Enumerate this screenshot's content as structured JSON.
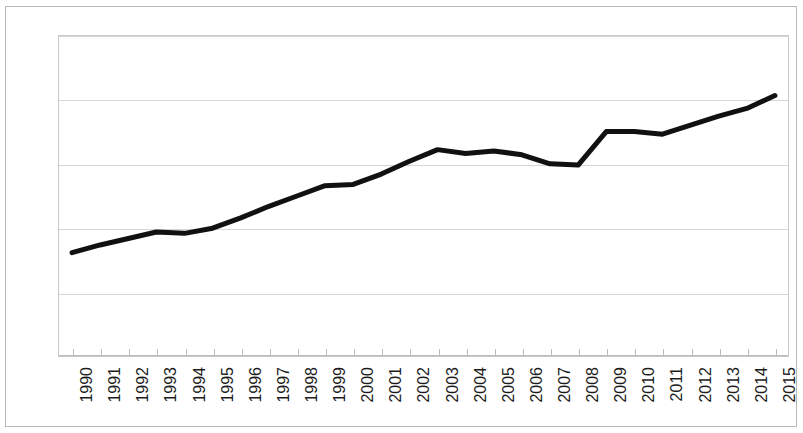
{
  "chart_data": {
    "type": "line",
    "title": "",
    "subtitle": "",
    "xlabel": "",
    "ylabel": "",
    "categories": [
      "1990",
      "1991",
      "1992",
      "1993",
      "1994",
      "1995",
      "1996",
      "1997",
      "1998",
      "1999",
      "2000",
      "2001",
      "2002",
      "2003",
      "2004",
      "2005",
      "2006",
      "2007",
      "2008",
      "2009",
      "2010",
      "2011",
      "2012",
      "2013",
      "2014",
      "2015"
    ],
    "series": [
      {
        "name": "series-1",
        "color": "#111111",
        "values": [
          0.81,
          0.87,
          0.92,
          0.97,
          0.96,
          1.0,
          1.08,
          1.17,
          1.25,
          1.33,
          1.34,
          1.42,
          1.52,
          1.61,
          1.58,
          1.6,
          1.57,
          1.5,
          1.49,
          1.75,
          1.75,
          1.73,
          1.8,
          1.87,
          1.93,
          2.03
        ]
      }
    ],
    "ylim": [
      0,
      2.5
    ],
    "yticks": [
      0,
      0.5,
      1,
      1.5,
      2,
      2.5
    ],
    "ytick_labels": [
      "0",
      "0.5",
      "1",
      "1.5",
      "2",
      "2.5"
    ],
    "grid": "horizontal",
    "legend": "none",
    "annotations": []
  },
  "style": {
    "line_color": "#111111",
    "grid_color": "#d6d6d6",
    "axis_color": "#bdbdbd",
    "text_color": "#1c1c1c",
    "background": "#ffffff",
    "line_width_px": 5
  }
}
